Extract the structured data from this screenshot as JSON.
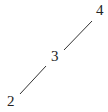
{
  "diagram": {
    "nodes": [
      {
        "id": "n2",
        "label": "2",
        "x": 7,
        "y": 94
      },
      {
        "id": "n3",
        "label": "3",
        "x": 51,
        "y": 49
      },
      {
        "id": "n4",
        "label": "4",
        "x": 96,
        "y": 3
      }
    ],
    "edges": [
      {
        "from": "2",
        "to": "3",
        "x1": 20,
        "y1": 94,
        "x2": 46,
        "y2": 66
      },
      {
        "from": "3",
        "to": "4",
        "x1": 64,
        "y1": 50,
        "x2": 92,
        "y2": 21
      }
    ],
    "line_color": "#333333",
    "text_color": "#222222"
  }
}
